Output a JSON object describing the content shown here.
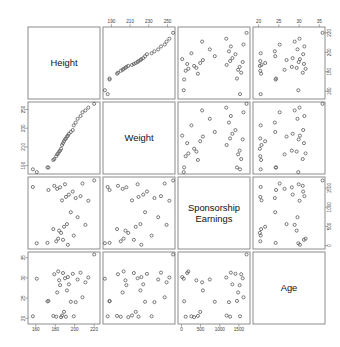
{
  "chart_data": {
    "type": "scatter",
    "title": "",
    "subtitle": "",
    "layout": "scatterplot-matrix",
    "grid": false,
    "legend_position": "none",
    "variables": [
      {
        "key": "height",
        "label": "Height",
        "ticks": [
          160,
          180,
          200,
          220
        ],
        "range": [
          152,
          226
        ],
        "tick_labels": [
          "160",
          "180",
          "200",
          "220"
        ]
      },
      {
        "key": "weight",
        "label": "Weight",
        "ticks": [
          190,
          210,
          230,
          250
        ],
        "range": [
          181,
          258
        ],
        "tick_labels": [
          "190",
          "210",
          "230",
          "250"
        ]
      },
      {
        "key": "earnings",
        "label": "Sponsorship Earnings",
        "label_lines": [
          "Sponsorship",
          "Earnings"
        ],
        "ticks": [
          0,
          500,
          1000,
          1500
        ],
        "range": [
          -90,
          1790
        ],
        "tick_labels": [
          "0",
          "500",
          "1000",
          "1500"
        ]
      },
      {
        "key": "age",
        "label": "Age",
        "ticks": [
          20,
          25,
          30,
          35
        ],
        "range": [
          18.6,
          36.4
        ],
        "tick_labels": [
          "20",
          "25",
          "30",
          "35"
        ]
      }
    ],
    "points": [
      {
        "height": 157,
        "weight": 186,
        "earnings": 1530,
        "age": 20.5
      },
      {
        "height": 161,
        "weight": 183,
        "earnings": 60,
        "age": 29.8
      },
      {
        "height": 172,
        "weight": 188,
        "earnings": 70,
        "age": 24.2
      },
      {
        "height": 173,
        "weight": 188,
        "earnings": 1450,
        "age": 24.3
      },
      {
        "height": 178,
        "weight": 196,
        "earnings": 430,
        "age": 20.6
      },
      {
        "height": 179,
        "weight": 197,
        "earnings": 1560,
        "age": 30.9
      },
      {
        "height": 181,
        "weight": 200,
        "earnings": 110,
        "age": 20.4
      },
      {
        "height": 182,
        "weight": 202,
        "earnings": 1480,
        "age": 26.4
      },
      {
        "height": 183,
        "weight": 203,
        "earnings": 180,
        "age": 31.6
      },
      {
        "height": 184,
        "weight": 205,
        "earnings": 390,
        "age": 29.4
      },
      {
        "height": 185,
        "weight": 206,
        "earnings": 1520,
        "age": 28.2
      },
      {
        "height": 186,
        "weight": 208,
        "earnings": 330,
        "age": 20.3
      },
      {
        "height": 187,
        "weight": 212,
        "earnings": 1180,
        "age": 20.7
      },
      {
        "height": 188,
        "weight": 214,
        "earnings": 150,
        "age": 31.2
      },
      {
        "height": 189,
        "weight": 216,
        "earnings": 490,
        "age": 21.6
      },
      {
        "height": 190,
        "weight": 218,
        "earnings": 1600,
        "age": 29.9
      },
      {
        "height": 191,
        "weight": 219,
        "earnings": 1270,
        "age": 20.4
      },
      {
        "height": 192,
        "weight": 221,
        "earnings": 560,
        "age": 26.9
      },
      {
        "height": 193,
        "weight": 222,
        "earnings": 20,
        "age": 30.2
      },
      {
        "height": 194,
        "weight": 224,
        "earnings": 1330,
        "age": 28.4
      },
      {
        "height": 196,
        "weight": 226,
        "earnings": 870,
        "age": 24.1
      },
      {
        "height": 198,
        "weight": 228,
        "earnings": 1410,
        "age": 31.0
      },
      {
        "height": 199,
        "weight": 233,
        "earnings": 260,
        "age": 20.5
      },
      {
        "height": 201,
        "weight": 236,
        "earnings": 1240,
        "age": 24.0
      },
      {
        "height": 203,
        "weight": 240,
        "earnings": 740,
        "age": 29.6
      },
      {
        "height": 206,
        "weight": 243,
        "earnings": 1290,
        "age": 31.3
      },
      {
        "height": 208,
        "weight": 247,
        "earnings": 1620,
        "age": 25.2
      },
      {
        "height": 211,
        "weight": 249,
        "earnings": 540,
        "age": 28.9
      },
      {
        "height": 214,
        "weight": 252,
        "earnings": 1170,
        "age": 30.1
      },
      {
        "height": 220,
        "weight": 256,
        "earnings": 1700,
        "age": 35.8
      }
    ],
    "relationships": [
      {
        "x": "height",
        "y": "weight",
        "correlation": "strong-positive"
      },
      {
        "x": "height",
        "y": "earnings",
        "correlation": "none"
      },
      {
        "x": "height",
        "y": "age",
        "correlation": "none"
      },
      {
        "x": "weight",
        "y": "earnings",
        "correlation": "none"
      },
      {
        "x": "weight",
        "y": "age",
        "correlation": "none"
      },
      {
        "x": "earnings",
        "y": "age",
        "correlation": "strong-negative"
      }
    ]
  }
}
